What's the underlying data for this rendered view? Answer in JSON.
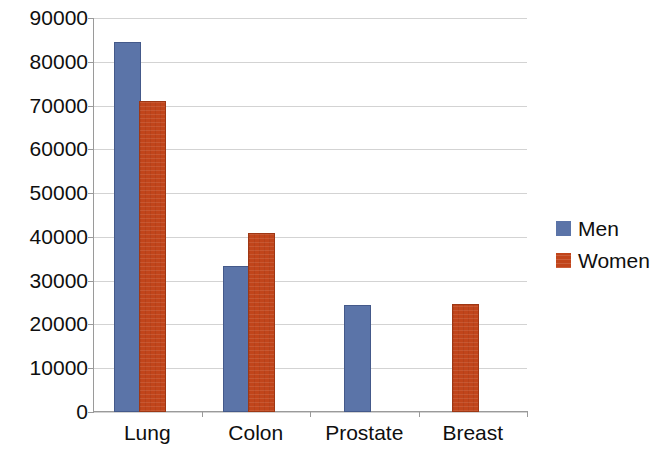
{
  "chart_data": {
    "type": "bar",
    "title": "",
    "subtitle": "",
    "xlabel": "",
    "ylabel": "",
    "categories": [
      "Lung",
      "Colon",
      "Prostate",
      "Breast"
    ],
    "series": [
      {
        "name": "Men",
        "color": "#5B74A8",
        "values": [
          84000,
          33000,
          24000,
          null
        ]
      },
      {
        "name": "Women",
        "color": "#C1451B",
        "values": [
          70500,
          40500,
          null,
          24200
        ]
      }
    ],
    "ylim": [
      0,
      90000
    ],
    "y_ticks": [
      0,
      10000,
      20000,
      30000,
      40000,
      50000,
      60000,
      70000,
      80000,
      90000
    ],
    "y_tick_labels": [
      "0",
      "10000",
      "20000",
      "30000",
      "40000",
      "50000",
      "60000",
      "70000",
      "80000",
      "90000"
    ],
    "grid": {
      "horizontal": true,
      "vertical": false
    },
    "legend": {
      "position": "right",
      "entries": [
        {
          "label": "Men",
          "color": "#5B74A8"
        },
        {
          "label": "Women",
          "color": "#C1451B"
        }
      ]
    },
    "annotations": []
  }
}
